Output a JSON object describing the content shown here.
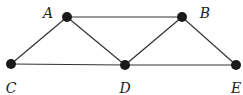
{
  "graph": {
    "nodes": [
      {
        "id": "A",
        "label": "A",
        "x": 67,
        "y": 17,
        "lx": 48,
        "ly": 18
      },
      {
        "id": "B",
        "label": "B",
        "x": 182,
        "y": 17,
        "lx": 205,
        "ly": 18
      },
      {
        "id": "C",
        "label": "C",
        "x": 11,
        "y": 64,
        "lx": 11,
        "ly": 93
      },
      {
        "id": "D",
        "label": "D",
        "x": 125,
        "y": 65,
        "lx": 125,
        "ly": 93
      },
      {
        "id": "E",
        "label": "E",
        "x": 236,
        "y": 65,
        "lx": 236,
        "ly": 93
      }
    ],
    "edges": [
      [
        "A",
        "B"
      ],
      [
        "A",
        "C"
      ],
      [
        "A",
        "D"
      ],
      [
        "B",
        "D"
      ],
      [
        "B",
        "E"
      ],
      [
        "C",
        "D"
      ],
      [
        "D",
        "E"
      ]
    ],
    "colors": {
      "node": "#1a1a1a",
      "edge": "#333333"
    }
  }
}
